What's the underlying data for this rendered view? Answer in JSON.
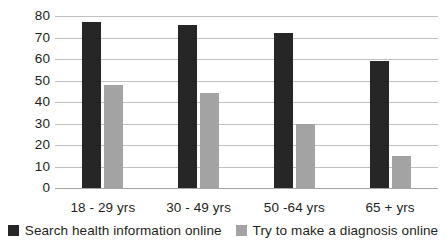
{
  "chart_data": {
    "type": "bar",
    "title": "",
    "xlabel": "",
    "ylabel": "",
    "ylim": [
      0,
      80
    ],
    "ytick_step": 10,
    "yticks": [
      80,
      70,
      60,
      50,
      40,
      30,
      20,
      10,
      0
    ],
    "grid": true,
    "legend_position": "bottom",
    "categories": [
      "18 - 29 yrs",
      "30 - 49 yrs",
      "50 -64 yrs",
      "65 + yrs"
    ],
    "series": [
      {
        "name": "Search health information online",
        "color": "#262626",
        "values": [
          77,
          76,
          72,
          59
        ]
      },
      {
        "name": "Try to make a diagnosis online",
        "color": "#a3a3a3",
        "values": [
          48,
          44,
          30,
          15
        ]
      }
    ]
  },
  "legend": {
    "items": [
      {
        "label": "Search health information online",
        "swatch": "dark-square-icon"
      },
      {
        "label": "Try to make a diagnosis online",
        "swatch": "light-square-icon"
      }
    ]
  },
  "colors": {
    "series_dark": "#262626",
    "series_light": "#a3a3a3",
    "gridline": "#bfbfbf",
    "baseline": "#a6a6a6",
    "text": "#231f20",
    "background": "#ffffff"
  }
}
